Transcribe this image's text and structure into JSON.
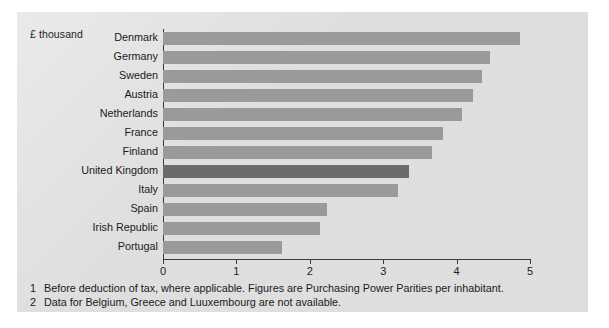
{
  "unit_label": "£ thousand",
  "axis": {
    "ticks": [
      "0",
      "1",
      "2",
      "3",
      "4",
      "5"
    ]
  },
  "footnotes": [
    {
      "num": "1",
      "text": "Before deduction of tax, where applicable. Figures are Purchasing Power Parities per inhabitant."
    },
    {
      "num": "2",
      "text": "Data for Belgium, Greece and Luuxembourg are not available."
    }
  ],
  "colors": {
    "panel_background": "#e2e2e2",
    "bar": "#9a9a9a",
    "bar_highlight": "#6b6b6b",
    "axis": "#3a3a3a",
    "text": "#1a1a1a"
  },
  "chart_data": {
    "type": "bar",
    "orientation": "horizontal",
    "title": "",
    "subtitle": "",
    "xlabel": "£ thousand",
    "ylabel": "",
    "xlim": [
      0,
      5
    ],
    "xticks": [
      0,
      1,
      2,
      3,
      4,
      5
    ],
    "grid": false,
    "legend": "none",
    "highlight_category": "United Kingdom",
    "categories": [
      "Denmark",
      "Germany",
      "Sweden",
      "Austria",
      "Netherlands",
      "France",
      "Finland",
      "United Kingdom",
      "Italy",
      "Spain",
      "Irish Republic",
      "Portugal"
    ],
    "values": [
      4.86,
      4.45,
      4.34,
      4.22,
      4.07,
      3.81,
      3.67,
      3.35,
      3.2,
      2.23,
      2.14,
      1.62
    ]
  }
}
